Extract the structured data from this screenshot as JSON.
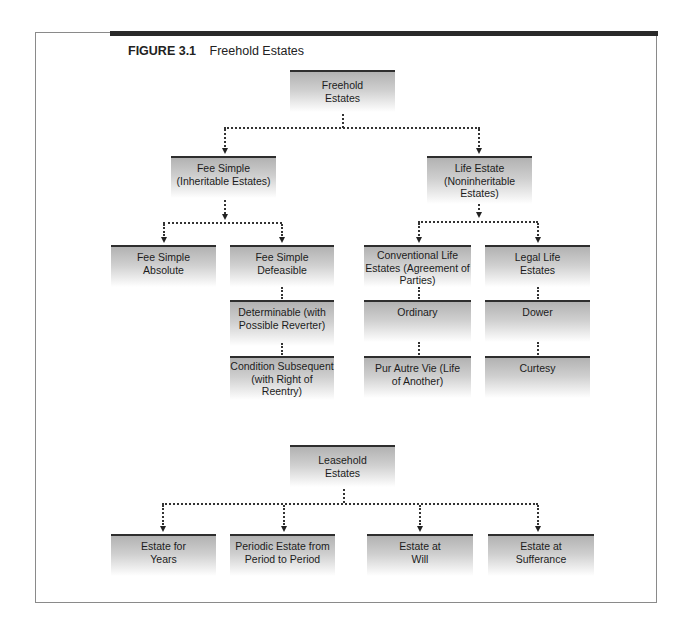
{
  "figure": {
    "number": "FIGURE 3.1",
    "title": "Freehold Estates"
  },
  "freehold": {
    "root": "Freehold Estates",
    "fee_simple": {
      "label": "Fee Simple (Inheritable Estates)",
      "children": {
        "absolute": "Fee Simple Absolute",
        "defeasible": "Fee Simple Defeasible",
        "determinable": "Determinable (with Possible Reverter)",
        "condition_subsequent": "Condition Subsequent (with Right of Reentry)"
      }
    },
    "life_estate": {
      "label": "Life Estate (Noninheritable Estates)",
      "children": {
        "conventional": "Conventional Life Estates (Agreement of Parties)",
        "ordinary": "Ordinary",
        "pur_autre_vie": "Pur Autre Vie (Life of Another)",
        "legal": "Legal Life Estates",
        "dower": "Dower",
        "curtesy": "Curtesy"
      }
    }
  },
  "leasehold": {
    "root": "Leasehold Estates",
    "children": {
      "years": "Estate for Years",
      "periodic": "Periodic Estate from Period to Period",
      "will": "Estate at Will",
      "sufferance": "Estate at Sufferance"
    }
  },
  "colors": {
    "box_top_border": "#2e2e2e",
    "box_gradient_top": "#b2b2b2",
    "box_gradient_bottom": "#ffffff",
    "connector": "#333333",
    "frame": "#8a8a8a",
    "heavy_rule": "#2a2a2a"
  }
}
